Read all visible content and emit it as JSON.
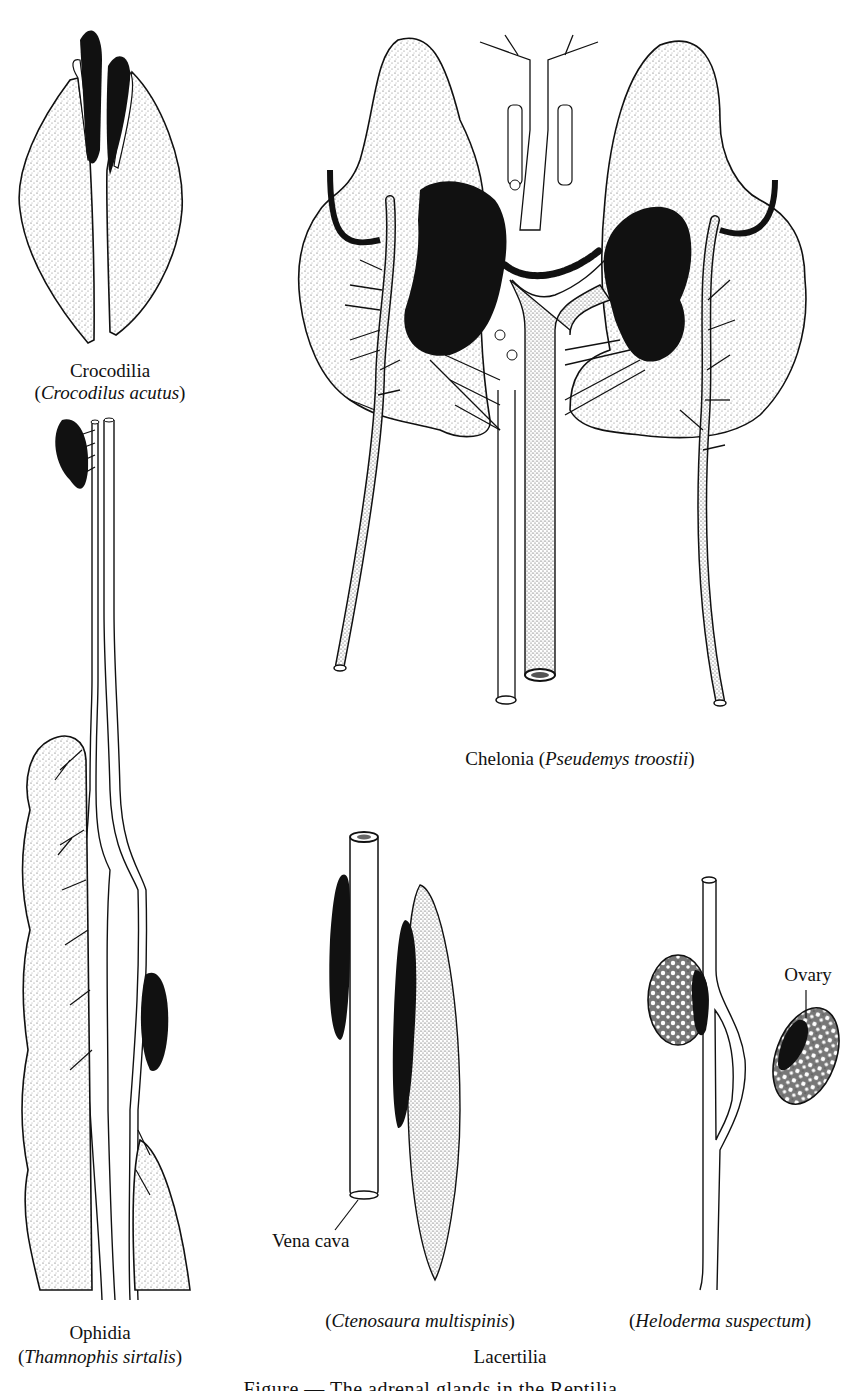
{
  "figure": {
    "caption_partial": "Figure — The adrenal glands in the Reptilia",
    "panels": [
      {
        "id": "crocodilia",
        "group_label": "Crocodilia",
        "species": "Crocodilus acutus"
      },
      {
        "id": "chelonia",
        "group_label": "Chelonia",
        "species": "Pseudemys troostii"
      },
      {
        "id": "ophidia",
        "group_label": "Ophidia",
        "species": "Thamnophis sirtalis"
      },
      {
        "id": "lacertilia-ctenosaura",
        "species": "Ctenosaura multispinis",
        "annotation": "Vena cava"
      },
      {
        "id": "lacertilia-heloderma",
        "species": "Heloderma suspectum",
        "annotation": "Ovary"
      }
    ],
    "lacertilia_group_label": "Lacertilia"
  },
  "colors": {
    "ink": "#111111",
    "stipple": "#9a9a9a",
    "paper": "#ffffff"
  }
}
